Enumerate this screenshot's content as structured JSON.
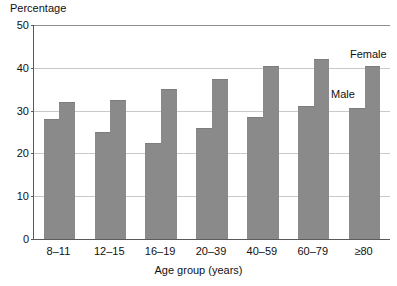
{
  "chart_data": {
    "type": "bar",
    "title": "",
    "xlabel": "Age group (years)",
    "ylabel": "Percentage",
    "categories": [
      "8–11",
      "12–15",
      "16–19",
      "20–39",
      "40–59",
      "60–79",
      "≥80"
    ],
    "series": [
      {
        "name": "Male",
        "values": [
          28,
          25,
          22.5,
          26,
          28.5,
          31,
          30.5
        ]
      },
      {
        "name": "Female",
        "values": [
          32,
          32.5,
          35,
          37.5,
          40.5,
          42,
          40.5
        ]
      }
    ],
    "ylim": [
      0,
      50
    ],
    "yticks": [
      0,
      10,
      20,
      30,
      40,
      50
    ],
    "ytick_labels": [
      "0",
      "10",
      "20",
      "30",
      "40",
      "50"
    ],
    "grid": true,
    "grid_axis": "y",
    "legend_position": "inline-annotations",
    "annotations": [
      {
        "text": "Female",
        "series": "Female"
      },
      {
        "text": "Male",
        "series": "Male"
      }
    ],
    "bar_color": "#8a8a8a",
    "gridline_color": "#c9c9c9",
    "axis_color": "#5a5a5a"
  }
}
